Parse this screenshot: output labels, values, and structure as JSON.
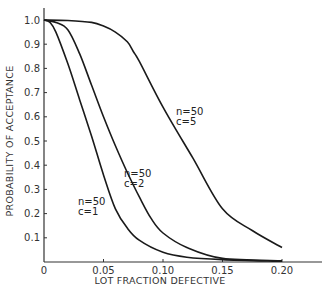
{
  "chart_data": {
    "type": "line",
    "title": "",
    "xlabel": "LOT FRACTION DEFECTIVE",
    "ylabel": "PROBABILITY OF ACCEPTANCE",
    "xlim": [
      0,
      0.2
    ],
    "ylim": [
      0,
      1.0
    ],
    "x_ticks": [
      "0",
      "0.05",
      "0.10",
      "0.15",
      "0.20"
    ],
    "y_ticks": [
      "0.1",
      "0.2",
      "0.3",
      "0.4",
      "0.5",
      "0.6",
      "0.7",
      "0.8",
      "0.9",
      "1.0"
    ],
    "grid": false,
    "legend": "none (inline curve annotations)",
    "series": [
      {
        "name": "n=50, c=1",
        "label_n": "n = 50",
        "label_c": "c = 1",
        "x": [
          0,
          0.005,
          0.01,
          0.02,
          0.03,
          0.04,
          0.05,
          0.06,
          0.07,
          0.08,
          0.1,
          0.12,
          0.15,
          0.2
        ],
        "y": [
          1.0,
          0.99,
          0.95,
          0.82,
          0.67,
          0.52,
          0.36,
          0.22,
          0.14,
          0.09,
          0.04,
          0.02,
          0.01,
          0.003
        ]
      },
      {
        "name": "n=50, c=2",
        "label_n": "n = 50",
        "label_c": "c = 2",
        "x": [
          0,
          0.01,
          0.02,
          0.03,
          0.04,
          0.05,
          0.06,
          0.07,
          0.08,
          0.09,
          0.1,
          0.12,
          0.15,
          0.2
        ],
        "y": [
          1.0,
          0.99,
          0.96,
          0.86,
          0.73,
          0.6,
          0.48,
          0.37,
          0.27,
          0.18,
          0.12,
          0.06,
          0.015,
          0.005
        ]
      },
      {
        "name": "n=50, c=5",
        "label_n": "n = 50",
        "label_c": "c = 5",
        "x": [
          0,
          0.02,
          0.04,
          0.05,
          0.06,
          0.07,
          0.075,
          0.08,
          0.1,
          0.125,
          0.15,
          0.175,
          0.2
        ],
        "y": [
          1.0,
          0.998,
          0.99,
          0.975,
          0.95,
          0.91,
          0.87,
          0.83,
          0.64,
          0.43,
          0.22,
          0.13,
          0.06
        ]
      }
    ]
  },
  "axes": {
    "xlabel": "LOT FRACTION DEFECTIVE",
    "ylabel": "PROBABILITY OF ACCEPTANCE",
    "x_ticks": [
      "0",
      "0.05",
      "0.10",
      "0.15",
      "0.20"
    ],
    "y_ticks": [
      "0.1",
      "0.2",
      "0.3",
      "0.4",
      "0.5",
      "0.6",
      "0.7",
      "0.8",
      "0.9",
      "1.0"
    ]
  },
  "annotations": {
    "c1": {
      "n": "n=50",
      "c": "c=1"
    },
    "c2": {
      "n": "n=50",
      "c": "c=2"
    },
    "c5": {
      "n": "n=50",
      "c": "c=5"
    }
  },
  "colors": {
    "line": "#1a1a1a",
    "axis": "#333333",
    "background": "#ffffff"
  }
}
